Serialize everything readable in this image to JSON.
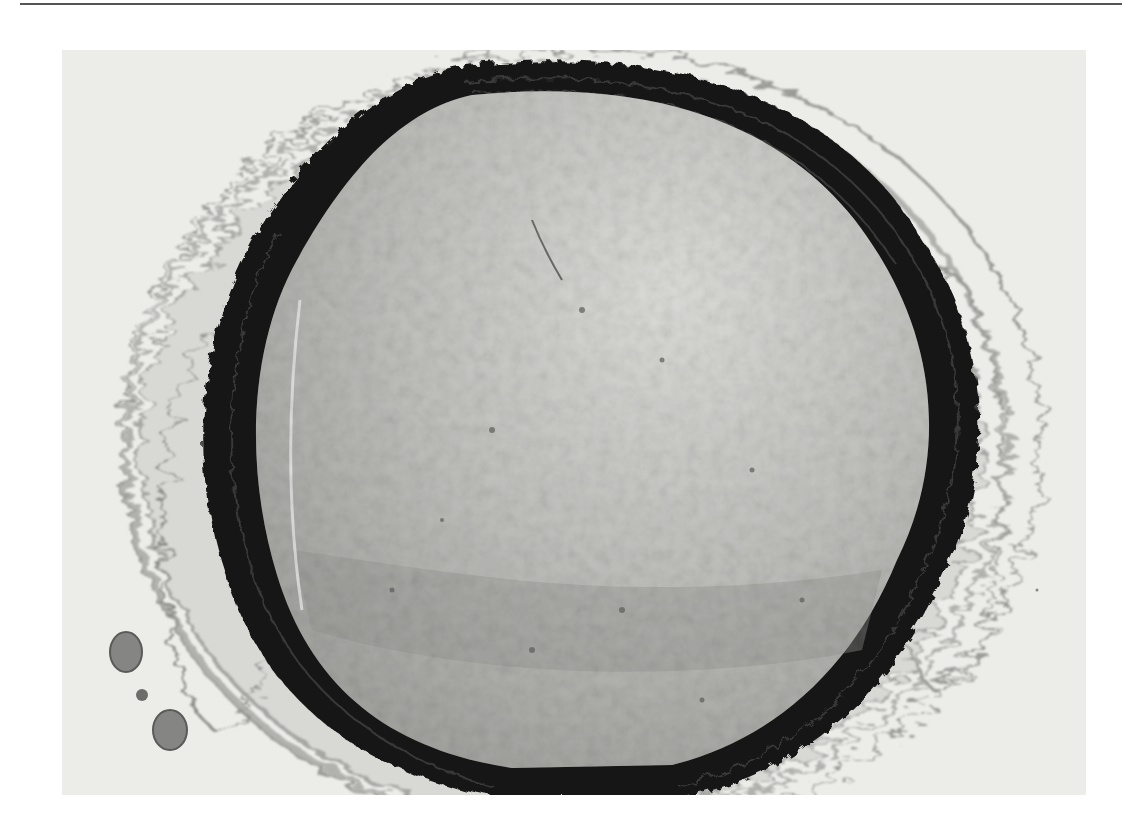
{
  "page": {
    "top_rule": true
  },
  "figure": {
    "kind": "micrograph",
    "tones": {
      "background": "#ececea",
      "lumen": "#b9b9b6",
      "lumen_light": "#d4d4d1",
      "wall": "#1c1c1c",
      "adventitia": "#c9c9c6"
    },
    "features": [
      {
        "name": "vessel-wall",
        "description": "thick dark wavy elastic lamina ring"
      },
      {
        "name": "lumen",
        "description": "granular grey content filling vessel"
      },
      {
        "name": "adventitia",
        "description": "loose fibrous connective tissue surrounding wall"
      },
      {
        "name": "small-vessels",
        "description": "two small round structures at lower left"
      }
    ]
  }
}
